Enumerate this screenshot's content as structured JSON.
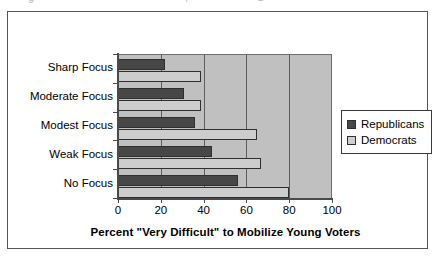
{
  "figure": {
    "clipped_top_text": [
      "g",
      ",",
      "z"
    ]
  },
  "legend": {
    "position": "right",
    "items": [
      {
        "label": "Republicans",
        "color": "#474747",
        "icon": "legend-swatch"
      },
      {
        "label": "Democrats",
        "color": "#cdcdcd",
        "icon": "legend-swatch"
      }
    ]
  },
  "axis": {
    "x_title": "Percent \"Very Difficult\" to Mobilize Young Voters",
    "x_ticks": [
      "0",
      "20",
      "40",
      "60",
      "80",
      "100"
    ],
    "y_labels": [
      "Sharp Focus",
      "Moderate Focus",
      "Modest Focus",
      "Weak Focus",
      "No Focus"
    ]
  },
  "chart_data": {
    "type": "bar",
    "orientation": "horizontal",
    "title": "",
    "subtitle": "",
    "xlabel": "Percent \"Very Difficult\" to Mobilize Young Voters",
    "ylabel": "",
    "xlim": [
      0,
      100
    ],
    "xticks": [
      0,
      20,
      40,
      60,
      80,
      100
    ],
    "grid": "vertical",
    "legend_position": "right",
    "categories": [
      "Sharp Focus",
      "Moderate Focus",
      "Modest Focus",
      "Weak Focus",
      "No Focus"
    ],
    "series": [
      {
        "name": "Republicans",
        "color": "#474747",
        "values": [
          22,
          31,
          36,
          44,
          56
        ]
      },
      {
        "name": "Democrats",
        "color": "#cdcdcd",
        "values": [
          39,
          39,
          65,
          67,
          80
        ]
      }
    ]
  }
}
